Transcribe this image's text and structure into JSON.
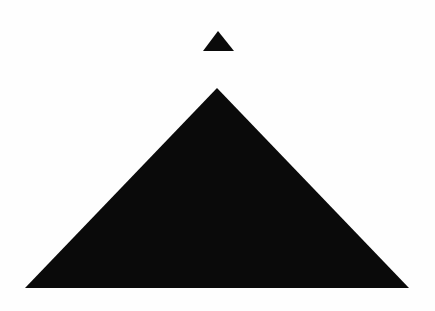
{
  "canvas": {
    "width": 435,
    "height": 311,
    "background_color": "#fefefe",
    "title": "Two black triangles on white background"
  },
  "palette": {
    "shape_fill": "#0a0a0a",
    "background": "#fefefe"
  },
  "shapes": [
    {
      "id": "small-triangle",
      "name": "small-upward-triangle",
      "type": "triangle",
      "fill": "#0a0a0a",
      "apex": {
        "x": 218,
        "y": 31
      },
      "base_left": {
        "x": 203,
        "y": 51
      },
      "base_right": {
        "x": 234,
        "y": 51
      },
      "width": 31,
      "height": 20,
      "points": "218,31 234,51 203,51"
    },
    {
      "id": "large-triangle",
      "name": "large-upward-triangle",
      "type": "triangle",
      "fill": "#0a0a0a",
      "apex": {
        "x": 217,
        "y": 88
      },
      "base_left": {
        "x": 25,
        "y": 288
      },
      "base_right": {
        "x": 409,
        "y": 288
      },
      "width": 384,
      "height": 200,
      "points": "217,88 409,288 25,288"
    }
  ]
}
